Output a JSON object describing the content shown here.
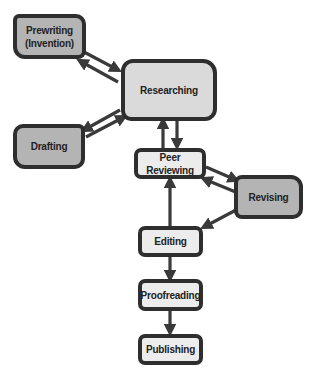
{
  "diagram": {
    "type": "writing-process-flowchart",
    "colors": {
      "border": "#2e2e2e",
      "dark_fill": "#b4b4b4",
      "mid_fill": "#dadada",
      "light_fill": "#ececec",
      "arrow": "#3a3a3a"
    },
    "nodes": {
      "prewriting": {
        "line1": "Prewriting",
        "line2": "(Invention)"
      },
      "researching": {
        "label": "Researching"
      },
      "drafting": {
        "label": "Drafting"
      },
      "peer_reviewing": {
        "label": "Peer Reviewing"
      },
      "revising": {
        "label": "Revising"
      },
      "editing": {
        "label": "Editing"
      },
      "proofreading": {
        "label": "Proofreading"
      },
      "publishing": {
        "label": "Publishing"
      }
    },
    "edges": [
      {
        "from": "Prewriting (Invention)",
        "to": "Researching"
      },
      {
        "from": "Researching",
        "to": "Prewriting (Invention)"
      },
      {
        "from": "Drafting",
        "to": "Researching"
      },
      {
        "from": "Researching",
        "to": "Drafting"
      },
      {
        "from": "Researching",
        "to": "Peer Reviewing"
      },
      {
        "from": "Peer Reviewing",
        "to": "Researching"
      },
      {
        "from": "Peer Reviewing",
        "to": "Revising"
      },
      {
        "from": "Revising",
        "to": "Peer Reviewing"
      },
      {
        "from": "Revising",
        "to": "Editing"
      },
      {
        "from": "Editing",
        "to": "Peer Reviewing"
      },
      {
        "from": "Editing",
        "to": "Proofreading"
      },
      {
        "from": "Proofreading",
        "to": "Publishing"
      }
    ]
  }
}
